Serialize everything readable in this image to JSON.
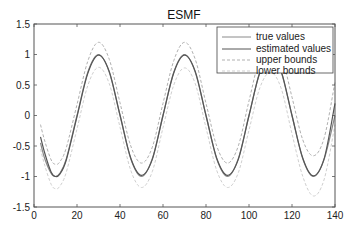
{
  "chart_data": {
    "type": "line",
    "title": "ESMF",
    "xlabel": "",
    "ylabel": "",
    "xlim": [
      0,
      140
    ],
    "ylim": [
      -1.5,
      1.5
    ],
    "xticks": [
      0,
      20,
      40,
      60,
      80,
      100,
      120,
      140
    ],
    "yticks": [
      -1.5,
      -1,
      -0.5,
      0,
      0.5,
      1,
      1.5
    ],
    "xtick_labels": [
      "0",
      "20",
      "40",
      "60",
      "80",
      "100",
      "120",
      "140"
    ],
    "ytick_labels": [
      "-1.5",
      "-1",
      "-0.5",
      "0",
      "0.5",
      "1",
      "1.5"
    ],
    "grid": false,
    "legend_position": "upper right",
    "x": [
      3,
      5,
      8,
      10,
      12,
      15,
      20,
      25,
      30,
      35,
      40,
      45,
      50,
      55,
      60,
      65,
      70,
      75,
      80,
      85,
      90,
      95,
      100,
      105,
      110,
      115,
      120,
      125,
      130,
      135,
      140
    ],
    "series": [
      {
        "name": "true values",
        "color": "#8a8a8a",
        "style": "solid",
        "values": [
          -0.45,
          -0.71,
          -0.95,
          -1.0,
          -0.95,
          -0.71,
          0.0,
          0.71,
          1.0,
          0.71,
          0.0,
          -0.71,
          -1.0,
          -0.71,
          0.0,
          0.71,
          1.0,
          0.71,
          0.0,
          -0.71,
          -1.0,
          -0.71,
          0.0,
          0.71,
          1.0,
          0.71,
          0.0,
          -0.71,
          -1.0,
          -0.71,
          0.0
        ]
      },
      {
        "name": "estimated values",
        "color": "#555555",
        "style": "solid",
        "values": [
          -0.35,
          -0.62,
          -0.93,
          -1.0,
          -0.96,
          -0.73,
          -0.02,
          0.69,
          0.99,
          0.72,
          0.01,
          -0.7,
          -0.98,
          -0.72,
          0.0,
          0.7,
          0.99,
          0.72,
          0.0,
          -0.7,
          -0.98,
          -0.72,
          0.0,
          0.7,
          0.98,
          0.72,
          0.0,
          -0.7,
          -0.99,
          -0.7,
          0.2
        ]
      },
      {
        "name": "upper bounds",
        "color": "#b0b0b0",
        "style": "dashed",
        "values": [
          -0.15,
          -0.42,
          -0.73,
          -0.8,
          -0.76,
          -0.53,
          0.18,
          0.89,
          1.2,
          0.92,
          0.21,
          -0.5,
          -0.78,
          -0.52,
          0.2,
          0.9,
          1.2,
          0.92,
          0.2,
          -0.5,
          -0.78,
          -0.5,
          0.24,
          0.95,
          1.25,
          1.0,
          0.3,
          -0.4,
          -0.66,
          -0.36,
          0.55
        ]
      },
      {
        "name": "lower bounds",
        "color": "#cfcfcf",
        "style": "dashed",
        "values": [
          -0.55,
          -0.82,
          -1.13,
          -1.2,
          -1.16,
          -0.93,
          -0.22,
          0.49,
          0.79,
          0.52,
          -0.19,
          -0.9,
          -1.18,
          -0.92,
          -0.2,
          0.5,
          0.78,
          0.52,
          -0.2,
          -0.9,
          -1.18,
          -0.94,
          -0.24,
          0.45,
          0.71,
          0.44,
          -0.3,
          -1.0,
          -1.32,
          -1.04,
          -0.15
        ]
      }
    ]
  },
  "legend": {
    "items": [
      {
        "label": "true values"
      },
      {
        "label": "estimated values"
      },
      {
        "label": "upper bounds"
      },
      {
        "label": "lower bounds"
      }
    ]
  }
}
